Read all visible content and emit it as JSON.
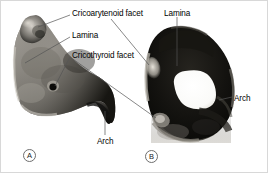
{
  "figure": {
    "background_color": "#ffffff",
    "border_color": "#d8d8d8",
    "width": 268,
    "height": 173
  },
  "labels": [
    {
      "id": "cricoarytenoid-facet",
      "text": "Cricoarytenoid facet",
      "x": 71,
      "y": 8
    },
    {
      "id": "lamina-left",
      "text": "Lamina",
      "x": 71,
      "y": 30
    },
    {
      "id": "cricothyroid-facet",
      "text": "Cricothyroid facet",
      "x": 71,
      "y": 50
    },
    {
      "id": "lamina-right",
      "text": "Lamina",
      "x": 163,
      "y": 8
    },
    {
      "id": "arch-left",
      "text": "Arch",
      "x": 96,
      "y": 136
    },
    {
      "id": "arch-right",
      "text": "Arch",
      "x": 233,
      "y": 93
    }
  ],
  "panels": [
    {
      "id": "panel-a",
      "tag": "A",
      "x": 22,
      "y": 148,
      "view": "lateral oblique view of cricoid cartilage specimen"
    },
    {
      "id": "panel-b",
      "tag": "B",
      "x": 144,
      "y": 149,
      "view": "superior view of cricoid cartilage ring with lumen"
    }
  ],
  "leaders": {
    "color": "#555555",
    "width": 0.7,
    "lines": [
      {
        "id": "leader-cricoarytenoid-left",
        "x1": 69,
        "y1": 14,
        "x2": 37,
        "y2": 26
      },
      {
        "id": "leader-cricoarytenoid-right",
        "x1": 110,
        "y1": 18,
        "x2": 148,
        "y2": 64
      },
      {
        "id": "leader-lamina-left",
        "x1": 69,
        "y1": 36,
        "x2": 24,
        "y2": 62
      },
      {
        "id": "leader-cricothyroid-a",
        "x1": 69,
        "y1": 56,
        "x2": 54,
        "y2": 85
      },
      {
        "id": "leader-cricothyroid-b",
        "x1": 69,
        "y1": 56,
        "x2": 155,
        "y2": 117
      },
      {
        "id": "leader-lamina-right",
        "x1": 176,
        "y1": 16,
        "x2": 176,
        "y2": 65
      },
      {
        "id": "leader-arch-left",
        "x1": 104,
        "y1": 134,
        "x2": 104,
        "y2": 110
      },
      {
        "id": "leader-arch-right",
        "x1": 231,
        "y1": 96,
        "x2": 218,
        "y2": 99
      }
    ]
  },
  "specimen_a": {
    "name": "cricoid-cartilage-lateral",
    "fill_light": "#b4b0aa",
    "fill_mid": "#7d7a74",
    "fill_dark": "#2b2a27"
  },
  "specimen_b": {
    "name": "cricoid-cartilage-superior",
    "fill_ring": "#1a1916",
    "fill_rim": "#9a968e",
    "lumen_color": "#ffffff"
  }
}
